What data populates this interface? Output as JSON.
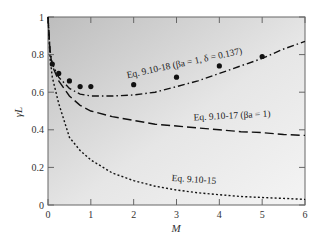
{
  "chart_data": {
    "type": "line",
    "title": "",
    "xlabel": "M",
    "ylabel": "γL",
    "xlim": [
      0,
      6
    ],
    "ylim": [
      0,
      1
    ],
    "x_ticks": [
      "0",
      "1",
      "2",
      "3",
      "4",
      "5",
      "6"
    ],
    "y_ticks": [
      "0",
      "0.2",
      "0.4",
      "0.6",
      "0.8",
      "1"
    ],
    "grid": false,
    "background": "gray gradient (darker at top-left)",
    "series": [
      {
        "name": "Eq. 9.10-18 (βa = 1, δ = 0.137)",
        "style": "dash-dot",
        "x": [
          0.0,
          0.05,
          0.1,
          0.25,
          0.5,
          0.75,
          1.0,
          1.5,
          2.0,
          2.5,
          3.0,
          3.5,
          4.0,
          4.5,
          5.0,
          5.5,
          6.0
        ],
        "y": [
          1.0,
          0.82,
          0.75,
          0.68,
          0.62,
          0.59,
          0.58,
          0.58,
          0.585,
          0.6,
          0.63,
          0.66,
          0.7,
          0.74,
          0.78,
          0.83,
          0.87
        ]
      },
      {
        "name": "Eq. 9.10-17 (βa = 1)",
        "style": "dashed",
        "x": [
          0.0,
          0.05,
          0.1,
          0.25,
          0.5,
          0.75,
          1.0,
          1.5,
          2.0,
          2.5,
          3.0,
          3.5,
          4.0,
          4.5,
          5.0,
          5.5,
          6.0
        ],
        "y": [
          1.0,
          0.81,
          0.74,
          0.66,
          0.58,
          0.53,
          0.5,
          0.47,
          0.45,
          0.43,
          0.42,
          0.41,
          0.4,
          0.39,
          0.385,
          0.375,
          0.37
        ]
      },
      {
        "name": "Eq. 9.10-15",
        "style": "dotted",
        "x": [
          0.0,
          0.05,
          0.1,
          0.25,
          0.5,
          0.75,
          1.0,
          1.5,
          2.0,
          2.5,
          3.0,
          3.5,
          4.0,
          4.5,
          5.0,
          5.5,
          6.0
        ],
        "y": [
          1.0,
          0.78,
          0.68,
          0.54,
          0.36,
          0.29,
          0.24,
          0.17,
          0.13,
          0.1,
          0.08,
          0.065,
          0.055,
          0.045,
          0.04,
          0.035,
          0.03
        ]
      },
      {
        "name": "Data points",
        "style": "markers",
        "x": [
          0.1,
          0.25,
          0.5,
          0.75,
          1.0,
          2.0,
          3.0,
          4.0,
          5.0
        ],
        "y": [
          0.75,
          0.7,
          0.66,
          0.63,
          0.63,
          0.64,
          0.68,
          0.74,
          0.79
        ]
      }
    ],
    "annotations": [
      {
        "text": "Eq. 9.10-18 (βa = 1, δ = 0.137)",
        "x": 3.2,
        "y": 0.74,
        "rotation": -12
      },
      {
        "text": "Eq. 9.10-17 (βa = 1)",
        "x": 4.3,
        "y": 0.46,
        "rotation": -3
      },
      {
        "text": "Eq. 9.10-15",
        "x": 3.4,
        "y": 0.12,
        "rotation": 4
      }
    ]
  }
}
